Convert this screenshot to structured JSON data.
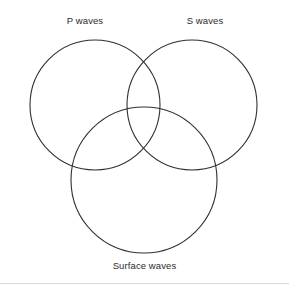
{
  "figure": {
    "type": "venn-diagram-3-set",
    "background_color": "#ffffff",
    "stroke_color": "#2f2f2f",
    "label_color": "#2b2b2b",
    "rule_color": "#d6d8da"
  },
  "labels": {
    "p_waves": "P waves",
    "s_waves": "S waves",
    "surface_waves": "Surface waves"
  },
  "chart_data": {
    "type": "venn",
    "title": "",
    "sets": [
      {
        "name": "P waves",
        "label": "P waves",
        "cx": 95,
        "cy": 105,
        "r": 65,
        "label_x": 85,
        "label_y": 21
      },
      {
        "name": "S waves",
        "label": "S waves",
        "cx": 192,
        "cy": 105,
        "r": 65,
        "label_x": 205,
        "label_y": 21
      },
      {
        "name": "Surface waves",
        "label": "Surface waves",
        "cx": 144,
        "cy": 180,
        "r": 73,
        "label_x": 144,
        "label_y": 267
      }
    ],
    "regions": [],
    "annotations": [],
    "legend": "none",
    "grid": false
  }
}
